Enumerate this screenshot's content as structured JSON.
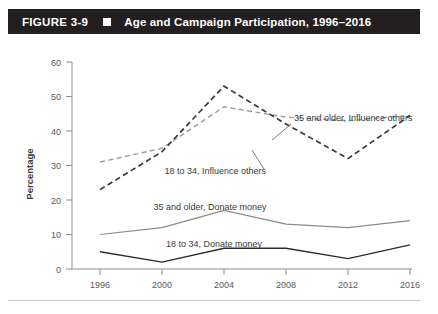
{
  "figure": {
    "number": "FIGURE 3-9",
    "separator_icon": "square-bullet-icon",
    "title": "Age and Campaign Participation, 1996–2016",
    "bar_color": "#231f20"
  },
  "chart_data": {
    "type": "line",
    "title": "Age and Campaign Participation, 1996–2016",
    "xlabel": "",
    "ylabel": "Percentage",
    "x": [
      1996,
      2000,
      2004,
      2008,
      2012,
      2016
    ],
    "categories": [
      "1996",
      "2000",
      "2004",
      "2008",
      "2012",
      "2016"
    ],
    "xlim": [
      1994,
      2018
    ],
    "ylim": [
      0,
      60
    ],
    "yticks": [
      0,
      10,
      20,
      30,
      40,
      50,
      60
    ],
    "ytick_labels": [
      "0",
      "10",
      "20",
      "30",
      "40",
      "50",
      "60"
    ],
    "grid": false,
    "legend": "inline-annotations",
    "series": [
      {
        "name": "35 and older, Influence others",
        "values": [
          31,
          35,
          47,
          44,
          43,
          44.5
        ],
        "color": "#9b9b9b",
        "style": "dashed"
      },
      {
        "name": "18 to 34, Influence others",
        "values": [
          23,
          34,
          53,
          42,
          32,
          44.5
        ],
        "color": "#3b3b3d",
        "style": "dashed"
      },
      {
        "name": "35 and older, Donate money",
        "values": [
          10,
          12,
          17,
          13,
          12,
          14
        ],
        "color": "#8a8a8a",
        "style": "solid"
      },
      {
        "name": "18 to 34, Donate money",
        "values": [
          5,
          2,
          6,
          6,
          3,
          7
        ],
        "color": "#2b2b2d",
        "style": "solid"
      }
    ],
    "annotations": [
      {
        "text": "35 and older, Influence others",
        "x": 2008.2,
        "y": 51
      },
      {
        "text": "18 to 34, Influence others",
        "x": 2004.7,
        "y": 33.5
      },
      {
        "text": "35 and older, Donate money",
        "x": 2002.6,
        "y": 21.5
      },
      {
        "text": "18 to 34, Donate money",
        "x": 2003.0,
        "y": 9.5
      }
    ]
  },
  "axis": {
    "y_title": "Percentage",
    "y_ticks": [
      "60",
      "50",
      "40",
      "30",
      "20",
      "10",
      "0"
    ],
    "x_ticks": [
      "1996",
      "2000",
      "2004",
      "2008",
      "2012",
      "2016"
    ]
  },
  "labels": {
    "s35_influence": "35 and older, Influence others",
    "s18_influence": "18 to 34, Influence others",
    "s35_donate": "35 and older, Donate money",
    "s18_donate": "18 to 34, Donate money"
  },
  "source_note": ""
}
